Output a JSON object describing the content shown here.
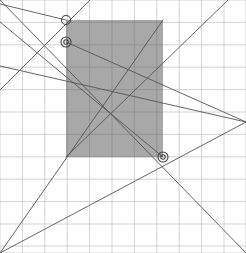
{
  "figure": {
    "width": 246,
    "height": 253,
    "background_color": "#ffffff"
  },
  "grid": {
    "label": "background-grid",
    "color": "#c8c8c8",
    "stroke_width": 0.8,
    "spacing_x": 22.4,
    "spacing_y": 22.4,
    "x_positions": [
      0,
      22.4,
      44.8,
      67.2,
      89.6,
      112,
      134.4,
      156.8,
      179.2,
      201.6,
      224,
      246
    ],
    "y_positions": [
      0,
      22.4,
      44.8,
      67.2,
      89.6,
      112,
      134.4,
      156.8,
      179.2,
      201.6,
      224,
      246,
      253
    ]
  },
  "rectangle": {
    "label": "gray-filled-rectangle",
    "x": 66,
    "y": 20,
    "width": 97,
    "height": 137,
    "fill_color": "#a8a8a8",
    "stroke": "none"
  },
  "lines": {
    "color": "#555555",
    "stroke_width": 0.9,
    "segments": [
      {
        "name": "line-a",
        "x1": 0,
        "y1": 253,
        "x2": 163,
        "y2": 20
      },
      {
        "name": "line-b",
        "x1": 0,
        "y1": 253,
        "x2": 246,
        "y2": 122
      },
      {
        "name": "line-c",
        "x1": 0,
        "y1": 0,
        "x2": 246,
        "y2": 253
      },
      {
        "name": "line-d",
        "x1": 0,
        "y1": 66,
        "x2": 246,
        "y2": 122
      },
      {
        "name": "line-e",
        "x1": 90,
        "y1": 0,
        "x2": 0,
        "y2": 90
      },
      {
        "name": "line-f",
        "x1": 228,
        "y1": 0,
        "x2": 66,
        "y2": 157
      },
      {
        "name": "line-g",
        "x1": 0,
        "y1": 22,
        "x2": 163,
        "y2": 157
      },
      {
        "name": "line-h",
        "x1": 66,
        "y1": 20,
        "x2": 0,
        "y2": 4
      },
      {
        "name": "line-i",
        "x1": 66,
        "y1": 42,
        "x2": 246,
        "y2": 122
      }
    ]
  },
  "markers": {
    "label": "intersection-markers",
    "stroke_color": "#444444",
    "fill_color": "none",
    "points": [
      {
        "name": "marker-upper",
        "cx": 66,
        "cy": 20,
        "r": 4.5,
        "double_ring": false
      },
      {
        "name": "marker-middle",
        "cx": 66,
        "cy": 42,
        "r": 5.0,
        "double_ring": true
      },
      {
        "name": "marker-lower",
        "cx": 163,
        "cy": 157,
        "r": 5.0,
        "double_ring": true
      }
    ]
  }
}
